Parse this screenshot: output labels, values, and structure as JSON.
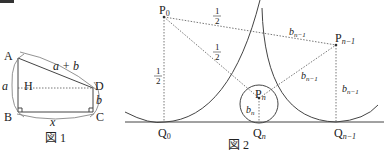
{
  "fig1": {
    "caption": "図 1",
    "points": {
      "A": "A",
      "B": "B",
      "C": "C",
      "D": "D",
      "H": "H"
    },
    "labels": {
      "side_AB": "a",
      "side_AD": "a + b",
      "side_DC": "b",
      "side_BC": "x"
    }
  },
  "fig2": {
    "caption": "図 2",
    "points": {
      "P0": "P",
      "P0_sub": "0",
      "Pn1": "P",
      "Pn1_sub": "n−1",
      "Pn": "P",
      "Pn_sub": "n",
      "Q0": "Q",
      "Q0_sub": "0",
      "Qn": "Q",
      "Qn_sub": "n",
      "Qn1": "Q",
      "Qn1_sub": "n−1"
    },
    "labels": {
      "half_num": "1",
      "half_den": "2",
      "b": "b",
      "b_n_sub": "n",
      "b_n1_sub": "n−1"
    }
  },
  "corner_mark": {
    "color": "#333333"
  }
}
